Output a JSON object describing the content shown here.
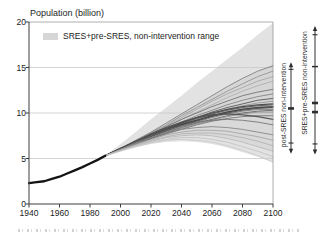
{
  "chart": {
    "title": "Population (billion)",
    "legend": {
      "label": "SRES+pre-SRES, non-intervention range",
      "swatch_color": "#d6d6d6"
    },
    "side_annotations": [
      {
        "label": "post-SRES non-intervention"
      },
      {
        "label": "SRES+pre-SRES non-intervention"
      }
    ]
  },
  "chart_data": {
    "type": "line",
    "title": "Population (billion)",
    "xlabel": "",
    "ylabel": "Population (billion)",
    "xlim": [
      1940,
      2100
    ],
    "ylim": [
      0,
      20
    ],
    "x_ticks": [
      1940,
      1960,
      1980,
      2000,
      2020,
      2040,
      2060,
      2080,
      2100
    ],
    "y_ticks": [
      0,
      5,
      10,
      15,
      20
    ],
    "grid_y": [
      5,
      10,
      15
    ],
    "legend_position": "top-left-inside",
    "historical": {
      "x": [
        1940,
        1945,
        1950,
        1955,
        1960,
        1965,
        1970,
        1975,
        1980,
        1985,
        1990
      ],
      "y": [
        2.3,
        2.4,
        2.5,
        2.75,
        3.0,
        3.35,
        3.7,
        4.05,
        4.45,
        4.85,
        5.3
      ],
      "color": "#141414",
      "width": 2.3
    },
    "band": {
      "label": "SRES+pre-SRES, non-intervention range",
      "color": "#e2e2e2",
      "upper": [
        5.3,
        6.6,
        7.9,
        9.3,
        10.6,
        11.9,
        13.3,
        14.6,
        15.9,
        17.2,
        18.6,
        19.9
      ],
      "lower": [
        5.3,
        5.8,
        6.2,
        6.6,
        6.8,
        6.9,
        6.8,
        6.6,
        6.2,
        5.7,
        5.2,
        4.6
      ]
    },
    "x_scenario": [
      1990,
      2000,
      2010,
      2020,
      2030,
      2040,
      2050,
      2060,
      2070,
      2080,
      2090,
      2100
    ],
    "series": [
      {
        "name": "scenario-01",
        "color": "#7a7a7a",
        "width": 0.9,
        "values": [
          5.3,
          6.1,
          7.0,
          7.9,
          8.9,
          9.9,
          10.9,
          11.9,
          12.9,
          13.8,
          14.6,
          15.2
        ]
      },
      {
        "name": "scenario-02",
        "color": "#8f8f8f",
        "width": 0.9,
        "values": [
          5.3,
          6.1,
          6.9,
          7.8,
          8.7,
          9.7,
          10.6,
          11.5,
          12.4,
          13.2,
          14.0,
          14.6
        ]
      },
      {
        "name": "scenario-03",
        "color": "#9b9b9b",
        "width": 0.8,
        "values": [
          5.3,
          6.0,
          6.8,
          7.7,
          8.6,
          9.5,
          10.4,
          11.3,
          12.1,
          12.8,
          13.5,
          14.0
        ]
      },
      {
        "name": "scenario-04",
        "color": "#a8a8a8",
        "width": 0.8,
        "values": [
          5.3,
          6.0,
          6.8,
          7.6,
          8.4,
          9.3,
          10.1,
          10.9,
          11.7,
          12.4,
          13.0,
          13.5
        ]
      },
      {
        "name": "scenario-05",
        "color": "#6b6b6b",
        "width": 0.9,
        "values": [
          5.3,
          6.1,
          6.9,
          7.7,
          8.5,
          9.3,
          10.0,
          10.7,
          11.3,
          11.9,
          12.3,
          12.6
        ]
      },
      {
        "name": "scenario-06",
        "color": "#7d7d7d",
        "width": 0.9,
        "values": [
          5.3,
          6.0,
          6.8,
          7.6,
          8.3,
          9.0,
          9.7,
          10.3,
          10.9,
          11.4,
          11.8,
          12.1
        ]
      },
      {
        "name": "scenario-07",
        "color": "#585858",
        "width": 1.0,
        "values": [
          5.3,
          6.1,
          6.8,
          7.5,
          8.2,
          8.9,
          9.5,
          10.1,
          10.6,
          11.0,
          11.4,
          11.6
        ]
      },
      {
        "name": "scenario-08",
        "color": "#8a8a8a",
        "width": 0.8,
        "values": [
          5.3,
          6.0,
          6.7,
          7.4,
          8.1,
          8.7,
          9.3,
          9.9,
          10.4,
          10.8,
          11.1,
          11.3
        ]
      },
      {
        "name": "scenario-09",
        "color": "#454545",
        "width": 1.2,
        "values": [
          5.3,
          6.1,
          6.9,
          7.6,
          8.3,
          8.9,
          9.5,
          10.0,
          10.4,
          10.7,
          10.9,
          11.0
        ]
      },
      {
        "name": "scenario-10",
        "color": "#565656",
        "width": 1.0,
        "values": [
          5.3,
          6.0,
          6.8,
          7.5,
          8.2,
          8.8,
          9.4,
          9.9,
          10.3,
          10.6,
          10.8,
          10.9
        ]
      },
      {
        "name": "scenario-11",
        "color": "#3d3d3d",
        "width": 1.5,
        "values": [
          5.3,
          6.1,
          6.8,
          7.5,
          8.1,
          8.7,
          9.2,
          9.7,
          10.1,
          10.4,
          10.6,
          10.7
        ]
      },
      {
        "name": "scenario-12",
        "color": "#4a4a4a",
        "width": 1.0,
        "values": [
          5.3,
          6.0,
          6.7,
          7.4,
          8.0,
          8.6,
          9.1,
          9.6,
          10.0,
          10.3,
          10.5,
          10.6
        ]
      },
      {
        "name": "scenario-13",
        "color": "#777777",
        "width": 0.9,
        "values": [
          5.3,
          6.0,
          6.7,
          7.3,
          7.9,
          8.5,
          9.0,
          9.5,
          9.9,
          10.2,
          10.4,
          10.4
        ]
      },
      {
        "name": "scenario-14",
        "color": "#5d5d5d",
        "width": 0.9,
        "values": [
          5.3,
          6.0,
          6.6,
          7.2,
          7.8,
          8.4,
          8.9,
          9.3,
          9.7,
          10.0,
          10.2,
          10.3
        ]
      },
      {
        "name": "scenario-15",
        "color": "#868686",
        "width": 0.8,
        "values": [
          5.3,
          5.9,
          6.6,
          7.2,
          7.8,
          8.3,
          8.8,
          9.2,
          9.6,
          9.9,
          10.1,
          10.1
        ]
      },
      {
        "name": "scenario-16",
        "color": "#6e6e6e",
        "width": 0.9,
        "values": [
          5.3,
          6.0,
          6.6,
          7.2,
          7.7,
          8.2,
          8.7,
          9.1,
          9.4,
          9.6,
          9.7,
          9.7
        ]
      },
      {
        "name": "scenario-17",
        "color": "#4f4f4f",
        "width": 1.3,
        "values": [
          5.3,
          6.1,
          6.9,
          7.7,
          8.4,
          9.0,
          9.5,
          9.8,
          9.9,
          9.8,
          9.6,
          9.3
        ]
      },
      {
        "name": "scenario-18",
        "color": "#6f6f6f",
        "width": 0.9,
        "values": [
          5.3,
          6.0,
          6.8,
          7.5,
          8.1,
          8.6,
          9.0,
          9.2,
          9.3,
          9.2,
          9.0,
          8.7
        ]
      },
      {
        "name": "scenario-19",
        "color": "#808080",
        "width": 0.9,
        "values": [
          5.3,
          6.0,
          6.7,
          7.3,
          7.8,
          8.2,
          8.4,
          8.5,
          8.4,
          8.2,
          7.9,
          7.6
        ]
      },
      {
        "name": "scenario-20",
        "color": "#9a9a9a",
        "width": 0.8,
        "values": [
          5.3,
          6.0,
          6.6,
          7.1,
          7.6,
          7.9,
          8.1,
          8.1,
          8.0,
          7.7,
          7.4,
          7.0
        ]
      },
      {
        "name": "scenario-21",
        "color": "#ababab",
        "width": 0.8,
        "values": [
          5.3,
          5.9,
          6.5,
          7.0,
          7.4,
          7.7,
          7.8,
          7.8,
          7.6,
          7.3,
          6.9,
          6.4
        ]
      },
      {
        "name": "scenario-22",
        "color": "#b3b3b3",
        "width": 0.8,
        "values": [
          5.3,
          5.9,
          6.4,
          6.9,
          7.3,
          7.5,
          7.6,
          7.5,
          7.2,
          6.8,
          6.3,
          5.8
        ]
      },
      {
        "name": "scenario-23",
        "color": "#bdbdbd",
        "width": 0.8,
        "values": [
          5.3,
          5.9,
          6.4,
          6.8,
          7.1,
          7.3,
          7.3,
          7.1,
          6.8,
          6.3,
          5.8,
          5.2
        ]
      },
      {
        "name": "scenario-24",
        "color": "#c6c6c6",
        "width": 0.8,
        "values": [
          5.3,
          5.8,
          6.3,
          6.7,
          7.0,
          7.1,
          7.0,
          6.8,
          6.4,
          5.9,
          5.3,
          4.6
        ]
      }
    ],
    "subbands": [
      {
        "upper": 0,
        "lower": 8,
        "opacity": 0.05
      },
      {
        "upper": 8,
        "lower": 16,
        "opacity": 0.06
      },
      {
        "upper": 16,
        "lower": 21,
        "opacity": 0.04
      }
    ],
    "range_bars": [
      {
        "label": "post-SRES non-intervention",
        "min": 5.7,
        "max": 15.4,
        "ticks": [
          {
            "value": 6.7,
            "kind": "small"
          },
          {
            "value": 10.5,
            "kind": "thick"
          },
          {
            "value": 14.8,
            "kind": "small"
          }
        ]
      },
      {
        "label": "SRES+pre-SRES non-intervention",
        "min": 5.6,
        "max": 19.4,
        "ticks": [
          {
            "value": 6.6,
            "kind": "small"
          },
          {
            "value": 10.1,
            "kind": "thick"
          },
          {
            "value": 11.1,
            "kind": "thick"
          },
          {
            "value": 15.1,
            "kind": "medium"
          },
          {
            "value": 18.6,
            "kind": "small"
          }
        ]
      }
    ]
  }
}
